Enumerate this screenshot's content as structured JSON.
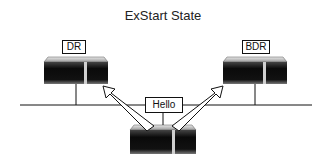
{
  "title": "ExStart State",
  "routers": {
    "dr": {
      "label": "DR"
    },
    "bdr": {
      "label": "BDR"
    },
    "new": {
      "label": ""
    }
  },
  "packet": {
    "label": "Hello"
  },
  "colors": {
    "line": "#111111",
    "router_body": "#1a1a1a",
    "router_top": "#bdbdbd",
    "arrow_fill": "#ffffff"
  }
}
